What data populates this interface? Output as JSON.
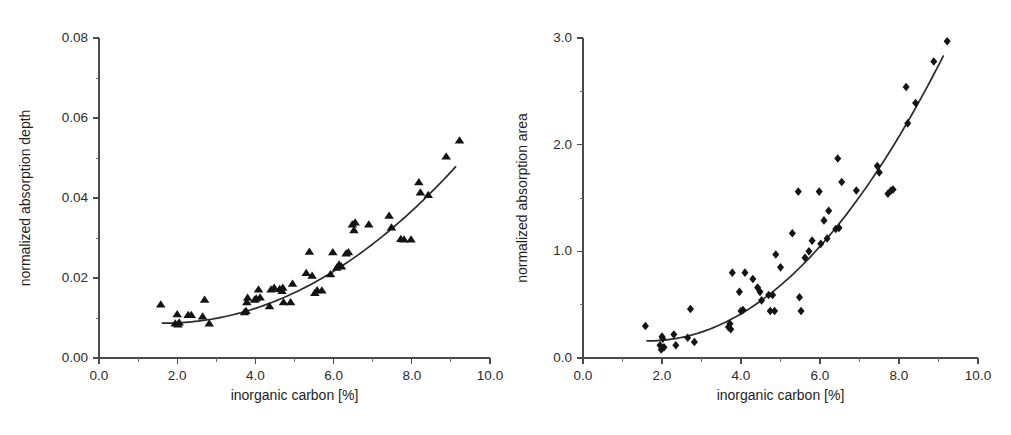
{
  "figure": {
    "background": "#ffffff",
    "marker_color": "#141414",
    "curve_color": "#2a2a2a",
    "axis_color": "#4a4a4a"
  },
  "chart_data": [
    {
      "panel": "left",
      "type": "scatter",
      "title": "",
      "xlabel": "inorganic carbon [%]",
      "ylabel": "normalized absorption depth",
      "marker": "triangle",
      "xlim": [
        0.0,
        10.0
      ],
      "ylim": [
        0.0,
        0.08
      ],
      "xticks": [
        0.0,
        2.0,
        4.0,
        6.0,
        8.0,
        10.0
      ],
      "xticklabels": [
        "0.0",
        "2.0",
        "4.0",
        "6.0",
        "8.0",
        "10.0"
      ],
      "xminor_step": 1.0,
      "yticks": [
        0.0,
        0.02,
        0.04,
        0.06,
        0.08
      ],
      "yticklabels": [
        "0.00",
        "0.02",
        "0.04",
        "0.06",
        "0.08"
      ],
      "yminor_step": 0.01,
      "grid": false,
      "legend": "none",
      "points": [
        [
          1.58,
          0.0134
        ],
        [
          1.95,
          0.0087
        ],
        [
          2.0,
          0.011
        ],
        [
          2.02,
          0.0084
        ],
        [
          2.05,
          0.0089
        ],
        [
          2.28,
          0.0108
        ],
        [
          2.36,
          0.0108
        ],
        [
          2.65,
          0.0104
        ],
        [
          2.7,
          0.0146
        ],
        [
          2.82,
          0.0087
        ],
        [
          3.72,
          0.0115
        ],
        [
          3.76,
          0.0118
        ],
        [
          3.78,
          0.014
        ],
        [
          3.8,
          0.0151
        ],
        [
          3.98,
          0.0146
        ],
        [
          4.02,
          0.0149
        ],
        [
          4.08,
          0.0172
        ],
        [
          4.12,
          0.0152
        ],
        [
          4.36,
          0.013
        ],
        [
          4.4,
          0.0172
        ],
        [
          4.48,
          0.0176
        ],
        [
          4.62,
          0.0173
        ],
        [
          4.68,
          0.0168
        ],
        [
          4.7,
          0.0176
        ],
        [
          4.72,
          0.014
        ],
        [
          4.9,
          0.014
        ],
        [
          4.95,
          0.0186
        ],
        [
          5.3,
          0.0213
        ],
        [
          5.38,
          0.0266
        ],
        [
          5.45,
          0.0206
        ],
        [
          5.52,
          0.0163
        ],
        [
          5.58,
          0.017
        ],
        [
          5.7,
          0.0169
        ],
        [
          5.92,
          0.021
        ],
        [
          5.98,
          0.0265
        ],
        [
          6.08,
          0.0226
        ],
        [
          6.14,
          0.0234
        ],
        [
          6.2,
          0.0229
        ],
        [
          6.32,
          0.0262
        ],
        [
          6.38,
          0.0265
        ],
        [
          6.48,
          0.0334
        ],
        [
          6.52,
          0.032
        ],
        [
          6.55,
          0.0339
        ],
        [
          6.9,
          0.0334
        ],
        [
          7.42,
          0.0356
        ],
        [
          7.48,
          0.0327
        ],
        [
          7.72,
          0.0298
        ],
        [
          7.8,
          0.0297
        ],
        [
          7.98,
          0.0297
        ],
        [
          8.18,
          0.044
        ],
        [
          8.22,
          0.0414
        ],
        [
          8.42,
          0.0408
        ],
        [
          8.88,
          0.0504
        ],
        [
          9.22,
          0.0544
        ]
      ],
      "fit": {
        "description": "monotonic increasing convex fit curve",
        "x_start": 1.62,
        "x_end": 9.12,
        "y_start": 0.0087,
        "y_end": 0.0478
      }
    },
    {
      "panel": "right",
      "type": "scatter",
      "title": "",
      "xlabel": "inorganic carbon [%]",
      "ylabel": "normalized absorption area",
      "marker": "diamond",
      "xlim": [
        0.0,
        10.0
      ],
      "ylim": [
        0.0,
        3.0
      ],
      "xticks": [
        0.0,
        2.0,
        4.0,
        6.0,
        8.0,
        10.0
      ],
      "xticklabels": [
        "0.0",
        "2.0",
        "4.0",
        "6.0",
        "8.0",
        "10.0"
      ],
      "xminor_step": 1.0,
      "yticks": [
        0.0,
        1.0,
        2.0,
        3.0
      ],
      "yticklabels": [
        "0.0",
        "1.0",
        "2.0",
        "3.0"
      ],
      "yminor_step": 0.5,
      "grid": false,
      "legend": "none",
      "points": [
        [
          1.58,
          0.3
        ],
        [
          1.95,
          0.12
        ],
        [
          1.98,
          0.08
        ],
        [
          2.0,
          0.2
        ],
        [
          2.02,
          0.18
        ],
        [
          2.05,
          0.1
        ],
        [
          2.3,
          0.22
        ],
        [
          2.35,
          0.12
        ],
        [
          2.65,
          0.19
        ],
        [
          2.72,
          0.46
        ],
        [
          2.82,
          0.15
        ],
        [
          3.68,
          0.29
        ],
        [
          3.72,
          0.32
        ],
        [
          3.74,
          0.27
        ],
        [
          3.78,
          0.8
        ],
        [
          3.96,
          0.62
        ],
        [
          4.0,
          0.44
        ],
        [
          4.05,
          0.45
        ],
        [
          4.1,
          0.8
        ],
        [
          4.3,
          0.74
        ],
        [
          4.42,
          0.66
        ],
        [
          4.48,
          0.62
        ],
        [
          4.52,
          0.54
        ],
        [
          4.7,
          0.59
        ],
        [
          4.74,
          0.44
        ],
        [
          4.8,
          0.59
        ],
        [
          4.85,
          0.44
        ],
        [
          4.88,
          0.97
        ],
        [
          5.0,
          0.85
        ],
        [
          5.3,
          1.17
        ],
        [
          5.45,
          1.56
        ],
        [
          5.48,
          0.57
        ],
        [
          5.52,
          0.44
        ],
        [
          5.62,
          0.94
        ],
        [
          5.72,
          1.0
        ],
        [
          5.8,
          1.1
        ],
        [
          5.98,
          1.56
        ],
        [
          6.02,
          1.07
        ],
        [
          6.1,
          1.29
        ],
        [
          6.18,
          1.12
        ],
        [
          6.22,
          1.38
        ],
        [
          6.4,
          1.21
        ],
        [
          6.45,
          1.87
        ],
        [
          6.48,
          1.22
        ],
        [
          6.55,
          1.65
        ],
        [
          6.92,
          1.57
        ],
        [
          7.45,
          1.8
        ],
        [
          7.5,
          1.74
        ],
        [
          7.72,
          1.54
        ],
        [
          7.8,
          1.57
        ],
        [
          7.85,
          1.58
        ],
        [
          8.18,
          2.54
        ],
        [
          8.22,
          2.2
        ],
        [
          8.42,
          2.39
        ],
        [
          8.88,
          2.78
        ],
        [
          9.22,
          2.97
        ]
      ],
      "fit": {
        "description": "monotonic increasing convex fit curve",
        "x_start": 1.62,
        "x_end": 9.12,
        "y_start": 0.16,
        "y_end": 2.83
      }
    }
  ]
}
